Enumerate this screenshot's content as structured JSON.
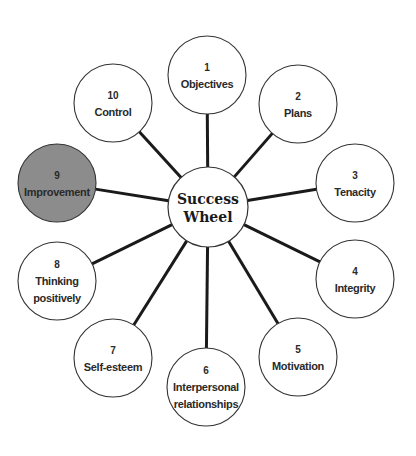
{
  "diagram": {
    "title": "Success Wheel",
    "hub": {
      "lines": [
        "Success",
        "Wheel"
      ],
      "cx": 208,
      "cy": 207,
      "r": 40
    },
    "colors": {
      "stroke": "#333333",
      "spoke": "#1a1a1a",
      "fill": "#ffffff",
      "highlight_fill": "#8c8c8c",
      "text": "#2a2a2a"
    },
    "nodes": [
      {
        "number": "1",
        "lines": [
          "Objectives"
        ],
        "cx": 207,
        "cy": 75,
        "highlighted": false
      },
      {
        "number": "2",
        "lines": [
          "Plans"
        ],
        "cx": 298,
        "cy": 104,
        "highlighted": false
      },
      {
        "number": "3",
        "lines": [
          "Tenacity"
        ],
        "cx": 355,
        "cy": 183,
        "highlighted": false
      },
      {
        "number": "4",
        "lines": [
          "Integrity"
        ],
        "cx": 355,
        "cy": 279,
        "highlighted": false
      },
      {
        "number": "5",
        "lines": [
          "Motivation"
        ],
        "cx": 298,
        "cy": 357,
        "highlighted": false
      },
      {
        "number": "6",
        "lines": [
          "Interpersonal",
          "relationships"
        ],
        "cx": 206,
        "cy": 387,
        "highlighted": false
      },
      {
        "number": "7",
        "lines": [
          "Self-esteem"
        ],
        "cx": 113,
        "cy": 358,
        "highlighted": false
      },
      {
        "number": "8",
        "lines": [
          "Thinking",
          "positively"
        ],
        "cx": 57,
        "cy": 281,
        "highlighted": false
      },
      {
        "number": "9",
        "lines": [
          "Improvement"
        ],
        "cx": 57,
        "cy": 183,
        "highlighted": true
      },
      {
        "number": "10",
        "lines": [
          "Control"
        ],
        "cx": 113,
        "cy": 103,
        "highlighted": false
      }
    ],
    "node_radius": 39
  }
}
